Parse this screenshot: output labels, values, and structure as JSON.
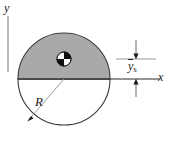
{
  "figure": {
    "kind": "engineering-diagram",
    "background_color": "#ffffff",
    "shade_color": "#a9a9a9",
    "outline_color": "#3a3a3a",
    "axis_color": "#2b2b2b",
    "leader_color": "#9a9a9a",
    "labels": {
      "y_axis": "y",
      "x_axis": "x",
      "radius": "R",
      "centroid_distance_symbol": "y",
      "centroid_distance_subscript": "s"
    },
    "geometry": {
      "circle_center_x": 64,
      "circle_center_y": 79,
      "circle_radius": 46,
      "x_axis_y": 79,
      "x_axis_start_x": 18,
      "x_axis_end_x": 160,
      "y_axis_x": 8,
      "y_axis_top_y": 16,
      "y_axis_bottom_y": 72,
      "centroid_x": 64,
      "centroid_y": 59,
      "centroid_marker_radius": 7,
      "radius_line_end_x": 28,
      "radius_line_end_y": 121,
      "dimension_line_x": 136,
      "dimension_top_y": 59,
      "dimension_bottom_y": 79,
      "extension_line_start_x": 116,
      "extension_line_end_x": 156
    }
  }
}
